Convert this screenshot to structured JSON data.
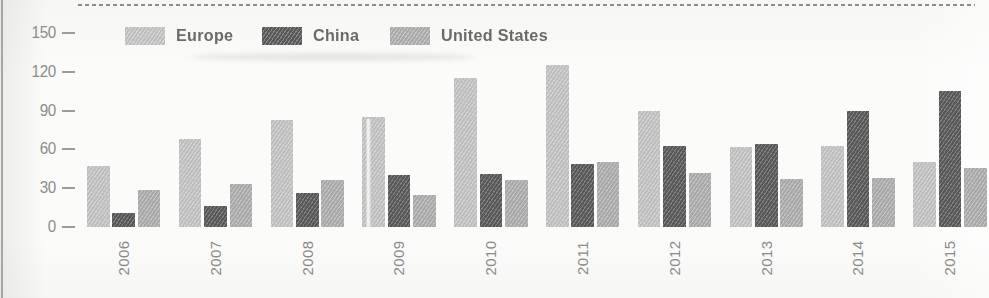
{
  "legend": {
    "items": [
      {
        "label": "Europe",
        "color": "#c8c8c8"
      },
      {
        "label": "China",
        "color": "#5c5c5c"
      },
      {
        "label": "United States",
        "color": "#b2b2b2"
      }
    ]
  },
  "chart_data": {
    "type": "bar",
    "title": "",
    "xlabel": "",
    "ylabel": "",
    "categories": [
      "2006",
      "2007",
      "2008",
      "2009",
      "2010",
      "2011",
      "2012",
      "2013",
      "2014",
      "2015"
    ],
    "series": [
      {
        "name": "Europe",
        "color": "#c8c8c8",
        "values": [
          47,
          68,
          83,
          85,
          115,
          125,
          90,
          62,
          63,
          50
        ]
      },
      {
        "name": "China",
        "color": "#5c5c5c",
        "values": [
          11,
          16,
          26,
          40,
          41,
          49,
          63,
          64,
          90,
          105
        ]
      },
      {
        "name": "United States",
        "color": "#b2b2b2",
        "values": [
          29,
          33,
          36,
          25,
          36,
          50,
          42,
          37,
          38,
          46
        ]
      }
    ],
    "ylim": [
      0,
      150
    ],
    "yticks": [
      0,
      30,
      60,
      90,
      120,
      150
    ],
    "grid": false,
    "legend_position": "top"
  }
}
